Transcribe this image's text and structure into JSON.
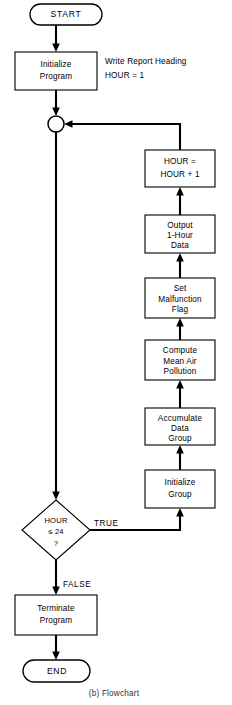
{
  "figure": {
    "caption": "(b) Flowchart"
  },
  "nodes": {
    "start": {
      "label": "START",
      "shape": "terminator"
    },
    "initialize_program": {
      "line1": "Initialize",
      "line2": "Program",
      "shape": "process"
    },
    "junction": {
      "label": "",
      "shape": "connector"
    },
    "hour_increment": {
      "line1": "HOUR =",
      "line2": "HOUR + 1",
      "shape": "process"
    },
    "output_data": {
      "line1": "Output",
      "line2": "1-Hour",
      "line3": "Data",
      "shape": "process"
    },
    "set_malfunction": {
      "line1": "Set",
      "line2": "Malfunction",
      "line3": "Flag",
      "shape": "process"
    },
    "compute_mean": {
      "line1": "Compute",
      "line2": "Mean Air",
      "line3": "Pollution",
      "shape": "process"
    },
    "accumulate_data": {
      "line1": "Accumulate",
      "line2": "Data",
      "line3": "Group",
      "shape": "process"
    },
    "initialize_group": {
      "line1": "Initialize",
      "line2": "Group",
      "shape": "process"
    },
    "hour_decision": {
      "line1": "HOUR",
      "line2": "≤ 24",
      "line3": "?",
      "shape": "decision"
    },
    "terminate_program": {
      "line1": "Terminate",
      "line2": "Program",
      "shape": "process"
    },
    "end": {
      "label": "END",
      "shape": "terminator"
    }
  },
  "annotations": {
    "init_note_line1": "Write Report Heading",
    "init_note_line2": "HOUR = 1"
  },
  "edge_labels": {
    "true_branch": "TRUE",
    "false_branch": "FALSE"
  },
  "colors": {
    "stroke": "#000000",
    "fill": "#ffffff",
    "caption": "#333333"
  }
}
